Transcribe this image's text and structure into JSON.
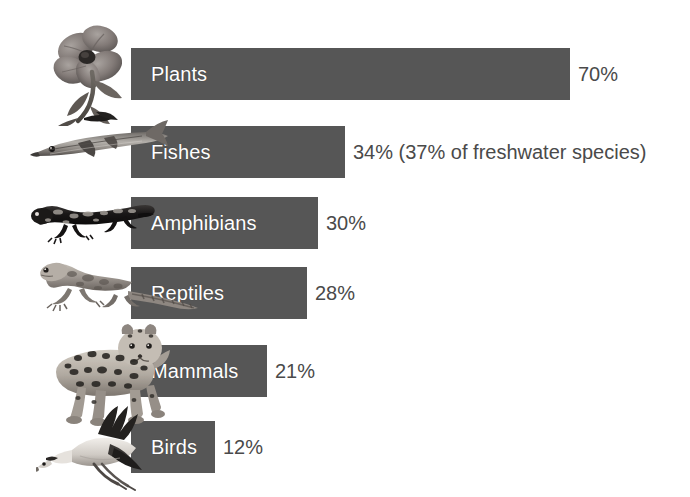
{
  "chart_data": {
    "type": "bar",
    "orientation": "horizontal",
    "title": "",
    "subtitle": "",
    "xlabel": "",
    "ylabel": "",
    "xlim": [
      0,
      100
    ],
    "grid": false,
    "legend": null,
    "units": "percent",
    "categories": [
      "Plants",
      "Fishes",
      "Amphibians",
      "Reptiles",
      "Mammals",
      "Birds"
    ],
    "values": [
      70,
      34,
      30,
      28,
      21,
      12
    ],
    "value_labels": [
      "70%",
      "34% (37% of freshwater species)",
      "30%",
      "28%",
      "21%",
      "12%"
    ],
    "annotations": [
      "37% of freshwater species"
    ],
    "bar_color": "#565656",
    "label_color": "#ffffff",
    "value_color": "#4a4a4a",
    "background_color": "#ffffff"
  },
  "rows": [
    {
      "category": "Plants",
      "value": 70,
      "value_label": "70%",
      "icon": "flower-photo",
      "bar_width_px": 439,
      "top_px": 48,
      "value_left_px": 578
    },
    {
      "category": "Fishes",
      "value": 34,
      "value_label": "34% (37% of freshwater species)",
      "icon": "fish-photo",
      "bar_width_px": 214,
      "top_px": 126,
      "value_left_px": 353
    },
    {
      "category": "Amphibians",
      "value": 30,
      "value_label": "30%",
      "icon": "salamander-photo",
      "bar_width_px": 187,
      "top_px": 197,
      "value_left_px": 326
    },
    {
      "category": "Reptiles",
      "value": 28,
      "value_label": "28%",
      "icon": "lizard-photo",
      "bar_width_px": 176,
      "top_px": 267,
      "value_left_px": 315
    },
    {
      "category": "Mammals",
      "value": 21,
      "value_label": "21%",
      "icon": "leopard-photo",
      "bar_width_px": 136,
      "top_px": 345,
      "value_left_px": 275
    },
    {
      "category": "Birds",
      "value": 12,
      "value_label": "12%",
      "icon": "crane-photo",
      "bar_width_px": 84,
      "top_px": 421,
      "value_left_px": 223
    }
  ]
}
